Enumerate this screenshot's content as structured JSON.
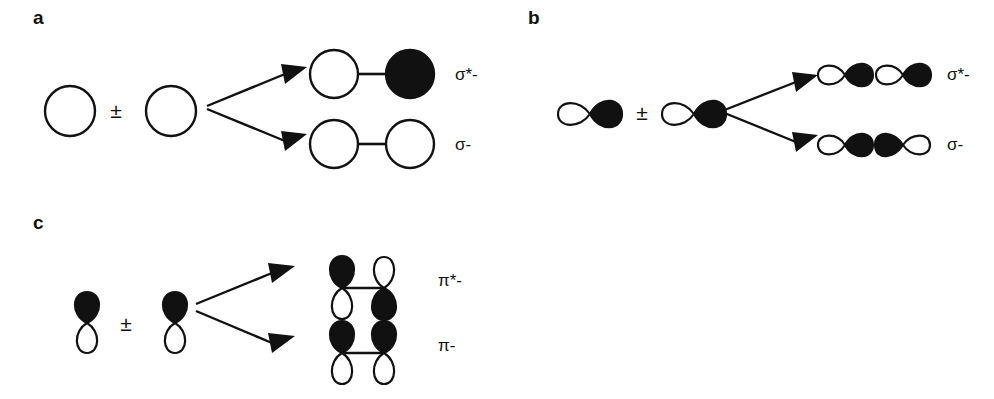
{
  "figure": {
    "type": "molecular-orbital-diagram",
    "background_color": "#ffffff",
    "line_color": "#111111",
    "lobe_positive_color": "#111111",
    "lobe_negative_color": "#ffffff",
    "operator_symbol": "±"
  },
  "panels": [
    {
      "letter": "a",
      "name": "s-orbital-sigma-combination",
      "reactant_orbital_type": "s",
      "reactants": [
        {
          "shape": "circle",
          "phase": "white"
        },
        {
          "shape": "circle",
          "phase": "white"
        }
      ],
      "operator": "±",
      "products": [
        {
          "label": "σ*-",
          "kind": "antibonding",
          "lobes": [
            "white",
            "black"
          ]
        },
        {
          "label": "σ-",
          "kind": "bonding",
          "lobes": [
            "white",
            "white"
          ]
        }
      ]
    },
    {
      "letter": "b",
      "name": "p-orbital-sigma-combination",
      "reactant_orbital_type": "p-sigma",
      "reactants": [
        {
          "shape": "p-horizontal",
          "phase": "white-black"
        },
        {
          "shape": "p-horizontal",
          "phase": "white-black"
        }
      ],
      "operator": "±",
      "products": [
        {
          "label": "σ*-",
          "kind": "antibonding",
          "lobes": [
            "white",
            "black",
            "white",
            "black"
          ]
        },
        {
          "label": "σ-",
          "kind": "bonding",
          "lobes": [
            "white",
            "black",
            "black",
            "white"
          ]
        }
      ]
    },
    {
      "letter": "c",
      "name": "p-orbital-pi-combination",
      "reactant_orbital_type": "p-pi",
      "reactants": [
        {
          "shape": "p-vertical",
          "phase": "black-top-white-bottom"
        },
        {
          "shape": "p-vertical",
          "phase": "black-top-white-bottom"
        }
      ],
      "operator": "±",
      "products": [
        {
          "label": "π*-",
          "kind": "antibonding",
          "lobes": [
            "black-top-white-bottom",
            "white-top-black-bottom"
          ]
        },
        {
          "label": "π-",
          "kind": "bonding",
          "lobes": [
            "black-top-white-bottom",
            "black-top-white-bottom"
          ]
        }
      ]
    }
  ]
}
